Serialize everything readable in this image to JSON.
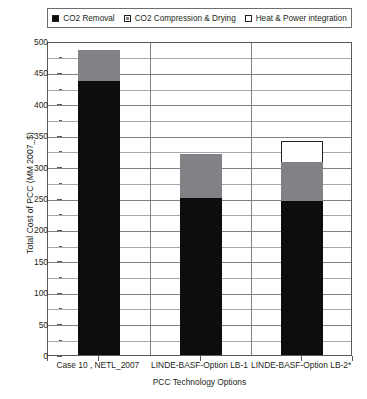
{
  "legend": {
    "position": "top",
    "entries": [
      {
        "label": "CO2 Removal",
        "swatch": "black-square-icon",
        "color": "#0d0d0d"
      },
      {
        "label": "CO2 Compression & Drying",
        "swatch": "gray-square-icon",
        "color": "#808285"
      },
      {
        "label": "Heat & Power integration",
        "swatch": "white-square-icon",
        "color": "#ffffff"
      }
    ]
  },
  "axes": {
    "ylabel": "Total Cost of PCC (MM 2007_$)",
    "xlabel": "PCC Technology Options",
    "yticks": [
      "0",
      "50",
      "100",
      "150",
      "200",
      "250",
      "300",
      "350",
      "400",
      "450",
      "500"
    ]
  },
  "chart_data": {
    "type": "bar",
    "stacked": true,
    "title": "",
    "xlabel": "PCC Technology Options",
    "ylabel": "Total Cost of PCC (MM 2007_$)",
    "ylim": [
      0,
      500
    ],
    "ytick_step": 50,
    "yminor_step": 25,
    "grid": true,
    "legend_position": "top",
    "categories": [
      "Case 10 , NETL_2007",
      "LINDE-BASF-Option LB-1",
      "LINDE-BASF-Option LB-2*"
    ],
    "series": [
      {
        "name": "CO2 Removal",
        "color": "#0d0d0d",
        "values": [
          437,
          250,
          245
        ]
      },
      {
        "name": "CO2 Compression & Drying",
        "color": "#808285",
        "values": [
          48,
          70,
          63
        ]
      },
      {
        "name": "Heat & Power integration",
        "color": "#ffffff",
        "values": [
          0,
          0,
          32
        ]
      }
    ],
    "totals": [
      485,
      320,
      340
    ]
  }
}
